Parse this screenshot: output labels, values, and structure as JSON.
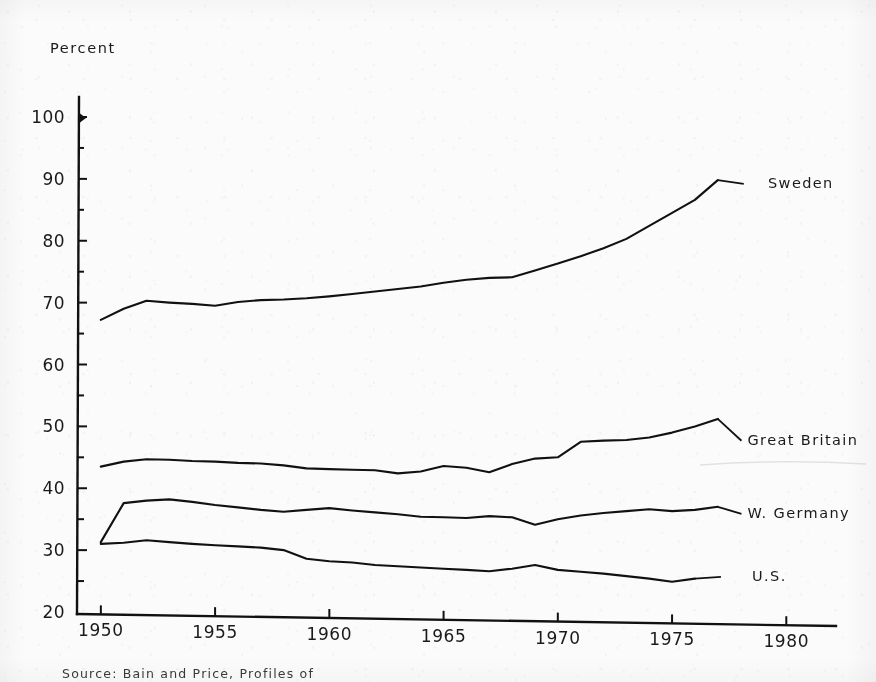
{
  "figure": {
    "unit_label": "Percent",
    "source_note": "Source:  Bain and Price, Profiles of"
  },
  "chart_data": {
    "type": "line",
    "title": "",
    "subtitle": "",
    "xlabel": "",
    "ylabel": "Percent",
    "xlim": [
      1949,
      1982
    ],
    "ylim": [
      20,
      100
    ],
    "ytick_values": [
      20,
      30,
      40,
      50,
      60,
      70,
      80,
      90,
      100
    ],
    "ytick_labels": [
      "20",
      "30",
      "40",
      "50",
      "60",
      "70",
      "80",
      "90",
      "100"
    ],
    "xtick_values": [
      1950,
      1955,
      1960,
      1965,
      1970,
      1975,
      1980
    ],
    "xtick_labels": [
      "1950",
      "1955",
      "1960",
      "1965",
      "1970",
      "1975",
      "1980"
    ],
    "minor_yticks": [
      25,
      35,
      45,
      55,
      65,
      75,
      85,
      95
    ],
    "grid": false,
    "legend_position": "right-inline-labels",
    "series": [
      {
        "name": "Sweden",
        "label": "Sweden",
        "label_year": 1979.2,
        "label_value": 89.5,
        "x": [
          1950,
          1951,
          1952,
          1953,
          1954,
          1955,
          1956,
          1957,
          1958,
          1959,
          1960,
          1961,
          1962,
          1963,
          1964,
          1965,
          1966,
          1967,
          1968,
          1969,
          1970,
          1971,
          1972,
          1973,
          1974,
          1975,
          1976,
          1977
        ],
        "values": [
          67.2,
          69.0,
          70.3,
          70.0,
          69.8,
          69.5,
          70.1,
          70.4,
          70.5,
          70.7,
          71.0,
          71.4,
          71.8,
          72.2,
          72.6,
          73.2,
          73.7,
          74.0,
          74.1,
          75.2,
          76.3,
          77.5,
          78.8,
          80.3,
          82.4,
          84.5,
          86.6,
          89.8
        ]
      },
      {
        "name": "Great Britain",
        "label": "Great Britain",
        "label_year": 1978.3,
        "label_value": 48.0,
        "x": [
          1950,
          1951,
          1952,
          1953,
          1954,
          1955,
          1956,
          1957,
          1958,
          1959,
          1960,
          1961,
          1962,
          1963,
          1964,
          1965,
          1966,
          1967,
          1968,
          1969,
          1970,
          1971,
          1972,
          1973,
          1974,
          1975,
          1976,
          1977
        ],
        "values": [
          43.5,
          44.3,
          44.7,
          44.6,
          44.4,
          44.3,
          44.1,
          44.0,
          43.7,
          43.2,
          43.1,
          43.0,
          42.9,
          42.4,
          42.7,
          43.6,
          43.3,
          42.6,
          43.9,
          44.8,
          45.0,
          47.5,
          47.7,
          47.8,
          48.2,
          49.0,
          50.0,
          51.2
        ]
      },
      {
        "name": "W. Germany",
        "label": "W. Germany",
        "label_year": 1978.3,
        "label_value": 36.2,
        "x": [
          1950,
          1951,
          1952,
          1953,
          1954,
          1955,
          1956,
          1957,
          1958,
          1959,
          1960,
          1961,
          1962,
          1963,
          1964,
          1965,
          1966,
          1967,
          1968,
          1969,
          1970,
          1971,
          1972,
          1973,
          1974,
          1975,
          1976,
          1977
        ],
        "values": [
          31.3,
          37.6,
          38.0,
          38.2,
          37.8,
          37.3,
          36.9,
          36.5,
          36.2,
          36.5,
          36.8,
          36.4,
          36.1,
          35.8,
          35.4,
          35.3,
          35.2,
          35.5,
          35.3,
          34.1,
          35.0,
          35.6,
          36.0,
          36.3,
          36.6,
          36.3,
          36.5,
          37.0
        ]
      },
      {
        "name": "U.S.",
        "label": "U.S.",
        "label_year": 1978.5,
        "label_value": 26.0,
        "x": [
          1950,
          1951,
          1952,
          1953,
          1954,
          1955,
          1956,
          1957,
          1958,
          1959,
          1960,
          1961,
          1962,
          1963,
          1964,
          1965,
          1966,
          1967,
          1968,
          1969,
          1970,
          1971,
          1972,
          1973,
          1974,
          1975,
          1976
        ],
        "values": [
          31.0,
          31.2,
          31.6,
          31.3,
          31.0,
          30.8,
          30.6,
          30.4,
          30.0,
          28.6,
          28.2,
          28.0,
          27.6,
          27.4,
          27.2,
          27.0,
          26.8,
          26.6,
          27.0,
          27.6,
          26.8,
          26.5,
          26.2,
          25.8,
          25.4,
          24.9,
          25.4
        ]
      }
    ]
  }
}
